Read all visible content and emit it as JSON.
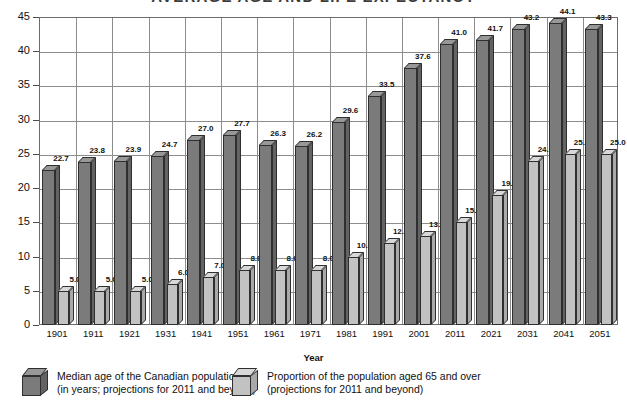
{
  "chart_data": {
    "type": "bar",
    "title": "AVERAGE AGE AND LIFE EXPECTANCY",
    "xlabel": "Year",
    "ylabel": "",
    "ylim": [
      0,
      45
    ],
    "yticks": [
      0,
      5,
      10,
      15,
      20,
      25,
      30,
      35,
      40,
      45
    ],
    "grid": true,
    "legend_position": "bottom",
    "categories": [
      "1901",
      "1911",
      "1921",
      "1931",
      "1941",
      "1951",
      "1961",
      "1971",
      "1981",
      "1991",
      "2001",
      "2011",
      "2021",
      "2031",
      "2041",
      "2051"
    ],
    "series": [
      {
        "name": "Median age of the Canadian population",
        "name_line2": "(in years; projections for 2011 and beyond)",
        "color": "#7b7b7b",
        "values": [
          22.7,
          23.8,
          23.9,
          24.7,
          27.0,
          27.7,
          26.3,
          26.2,
          29.6,
          33.5,
          37.6,
          41.0,
          41.7,
          43.2,
          44.1,
          43.3
        ],
        "labels": [
          "22.7",
          "23.8",
          "23.9",
          "24.7",
          "27.0",
          "27.7",
          "26.3",
          "26.2",
          "29.6",
          "33.5",
          "37.6",
          "41.0",
          "41.7",
          "43.2",
          "44.1",
          "43.3"
        ]
      },
      {
        "name": "Proportion of the population aged 65 and over",
        "name_line2": "(projections for 2011 and beyond)",
        "color": "#c2c2c2",
        "values": [
          5.0,
          5.0,
          5.0,
          6.0,
          7.0,
          8.0,
          8.0,
          8.0,
          10.0,
          12.0,
          13.0,
          15.0,
          19.0,
          24.0,
          25.0,
          25.0
        ],
        "labels": [
          "5.0",
          "5.0",
          "5.0",
          "6.0",
          "7.0",
          "8.0",
          "8.0",
          "8.0",
          "10.0",
          "12.0",
          "13.0",
          "15.0",
          "19.0",
          "24.0",
          "25.0",
          "25.0"
        ]
      }
    ]
  },
  "axis": {
    "y_tick_labels": [
      "45",
      "40",
      "35",
      "30",
      "25",
      "20",
      "15",
      "10",
      "5",
      "0"
    ],
    "x_title": "Year"
  },
  "legend": {
    "items": [
      {
        "cube": "dark-cube-icon",
        "line1": "Median age of the Canadian population",
        "line2": "(in years; projections for 2011 and beyond)"
      },
      {
        "cube": "light-cube-icon",
        "line1": "Proportion of the population aged 65 and over",
        "line2": "(projections for 2011 and beyond)"
      }
    ]
  },
  "colors": {
    "series_dark": "#7b7b7b",
    "series_light": "#c2c2c2",
    "grid": "#8d8d8d",
    "frame": "#6b6b6b",
    "text": "#111111"
  }
}
